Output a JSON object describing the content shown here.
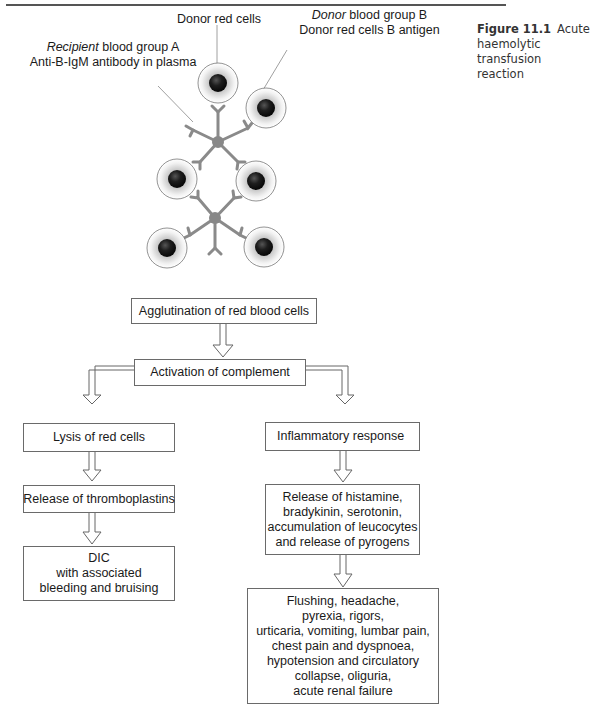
{
  "figure": {
    "number": "Figure 11.1",
    "title_lines": [
      "Acute",
      "haemolytic transfusion",
      "reaction"
    ]
  },
  "illustration": {
    "labels": {
      "donor_cells": "Donor red cells",
      "donor_group_italic": "Donor",
      "donor_group_rest": " blood group B",
      "donor_antigen": "Donor red cells B antigen",
      "recipient_italic": "Recipient",
      "recipient_rest": " blood group A",
      "antibody": "Anti-B-IgM antibody in plasma"
    },
    "colors": {
      "antibody": "#8a8a8a",
      "cell_nucleus": "#1e1e1e",
      "cell_outline": "#777777"
    }
  },
  "flowchart": {
    "agglutination": {
      "lines": [
        "Agglutination of red blood cells"
      ]
    },
    "complement": {
      "lines": [
        "Activation of complement"
      ]
    },
    "left_branch": [
      {
        "lines": [
          "Lysis of red cells"
        ]
      },
      {
        "lines": [
          "Release of thromboplastins"
        ]
      },
      {
        "lines": [
          "DIC",
          "with associated",
          "bleeding and bruising"
        ]
      }
    ],
    "right_branch": [
      {
        "lines": [
          "Inflammatory response"
        ]
      },
      {
        "lines": [
          "Release of histamine,",
          "bradykinin, serotonin,",
          "accumulation of leucocytes",
          "and release of pyrogens"
        ]
      },
      {
        "lines": [
          "Flushing, headache,",
          "pyrexia, rigors,",
          "urticaria, vomiting, lumbar pain,",
          "chest pain and dyspnoea,",
          "hypotension and circulatory",
          "collapse, oliguria,",
          "acute renal failure"
        ]
      }
    ]
  }
}
